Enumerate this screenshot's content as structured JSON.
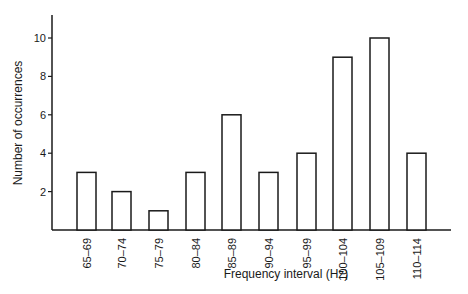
{
  "chart_data": {
    "type": "bar",
    "title": "",
    "xlabel": "Frequency interval (Hz)",
    "ylabel": "Number of occurrences",
    "categories": [
      "65–69",
      "70–74",
      "75–79",
      "80–84",
      "85–89",
      "90–94",
      "95–99",
      "100–104",
      "105–109",
      "110–114"
    ],
    "values": [
      3,
      2,
      1,
      3,
      6,
      3,
      4,
      9,
      10,
      4
    ],
    "yticks": [
      2,
      4,
      6,
      8,
      10
    ],
    "ylim": [
      0,
      11
    ],
    "grid": false,
    "legend": null,
    "bar_style": {
      "fill": "#ffffff",
      "stroke": "#1a1a1a"
    }
  }
}
